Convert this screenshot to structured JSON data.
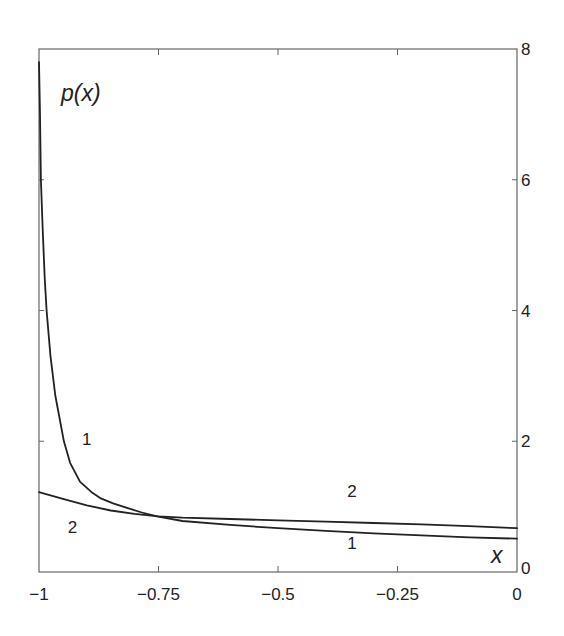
{
  "chart_data": {
    "type": "line",
    "title": "",
    "xlabel": "x",
    "ylabel": "p(x)",
    "xlim": [
      -1,
      0
    ],
    "ylim": [
      0,
      8
    ],
    "grid": false,
    "legend": "none (curves labeled inline with '1' and '2')",
    "x_ticks": [
      -1,
      -0.75,
      -0.5,
      -0.25,
      0
    ],
    "x_tick_labels": [
      "-1",
      "-0.75",
      "-0.5",
      "-0.25",
      "0"
    ],
    "y_ticks": [
      0,
      2,
      4,
      6,
      8
    ],
    "y_tick_labels": [
      "0",
      "2",
      "4",
      "6",
      "8"
    ],
    "y_axis_side": "right",
    "series": [
      {
        "name": "1",
        "x": [
          -1.0,
          -0.998,
          -0.996,
          -0.992,
          -0.988,
          -0.984,
          -0.976,
          -0.966,
          -0.948,
          -0.935,
          -0.914,
          -0.89,
          -0.872,
          -0.845,
          -0.816,
          -0.785,
          -0.753,
          -0.7,
          -0.6,
          -0.5,
          -0.4,
          -0.3,
          -0.2,
          -0.1,
          0.0
        ],
        "values": [
          7.8,
          7.0,
          6.0,
          5.2,
          4.5,
          4.0,
          3.3,
          2.7,
          2.0,
          1.67,
          1.38,
          1.22,
          1.13,
          1.05,
          0.98,
          0.91,
          0.85,
          0.78,
          0.72,
          0.67,
          0.63,
          0.59,
          0.56,
          0.53,
          0.51
        ]
      },
      {
        "name": "2",
        "x": [
          -1.0,
          -0.95,
          -0.9,
          -0.85,
          -0.8,
          -0.75,
          -0.7,
          -0.6,
          -0.5,
          -0.4,
          -0.3,
          -0.2,
          -0.1,
          0.0
        ],
        "values": [
          1.22,
          1.12,
          1.02,
          0.94,
          0.89,
          0.85,
          0.83,
          0.81,
          0.79,
          0.77,
          0.75,
          0.73,
          0.7,
          0.67
        ]
      }
    ],
    "annotations": [
      {
        "text": "1",
        "x": -0.9,
        "y": 1.95,
        "refers_to": "series 1 (upper-left)"
      },
      {
        "text": "2",
        "x": -0.93,
        "y": 0.6,
        "refers_to": "series 2 (lower-left)"
      },
      {
        "text": "2",
        "x": -0.345,
        "y": 1.15,
        "refers_to": "series 2 (right)"
      },
      {
        "text": "1",
        "x": -0.345,
        "y": 0.35,
        "refers_to": "series 1 (right)"
      }
    ]
  },
  "labels": {
    "ylabel": "p(x)",
    "xlabel": "x",
    "curve_labels": [
      "1",
      "2",
      "2",
      "1"
    ]
  }
}
